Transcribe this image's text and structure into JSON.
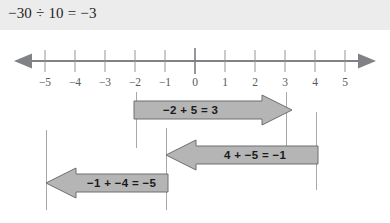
{
  "header": {
    "equation": "−30 ÷ 10 = −3",
    "band_color": "#ececed"
  },
  "numberline": {
    "axis_label": "horizontal number line with arrowheads on both ends",
    "ticks": [
      {
        "value": -5,
        "label": "−5",
        "x": 45
      },
      {
        "value": -4,
        "label": "−4",
        "x": 75
      },
      {
        "value": -3,
        "label": "−3",
        "x": 105
      },
      {
        "value": -2,
        "label": "−2",
        "x": 135
      },
      {
        "value": -1,
        "label": "−1",
        "x": 165
      },
      {
        "value": 0,
        "label": "0",
        "x": 195
      },
      {
        "value": 1,
        "label": "1",
        "x": 225
      },
      {
        "value": 2,
        "label": "2",
        "x": 255
      },
      {
        "value": 3,
        "label": "3",
        "x": 285
      },
      {
        "value": 4,
        "label": "4",
        "x": 315
      },
      {
        "value": 5,
        "label": "5",
        "x": 345
      }
    ],
    "line_color": "#808285",
    "tick_color": "#939598",
    "label_color": "#58595b"
  },
  "arrows": [
    {
      "id": "arrow-1",
      "equation": "−2 + 5 = 3",
      "direction": "right",
      "start_value": -2,
      "end_value": 3,
      "fill": "#b5b5b5",
      "stroke": "#6d6e71"
    },
    {
      "id": "arrow-2",
      "equation": "4 + −5 = −1",
      "direction": "left",
      "start_value": 4,
      "end_value": -1,
      "fill": "#b5b5b5",
      "stroke": "#6d6e71"
    },
    {
      "id": "arrow-3",
      "equation": "−1 + −4 = −5",
      "direction": "left",
      "start_value": -1,
      "end_value": -5,
      "fill": "#b5b5b5",
      "stroke": "#6d6e71"
    }
  ],
  "guides": [
    {
      "name": "guide-minus-5",
      "value": -5,
      "x": 46,
      "top": 130,
      "height": 80
    },
    {
      "name": "guide-minus-2",
      "value": -2,
      "x": 136,
      "top": 92,
      "height": 56
    },
    {
      "name": "guide-minus-1",
      "value": -1,
      "x": 166,
      "top": 128,
      "height": 82
    },
    {
      "name": "guide-3",
      "value": 3,
      "x": 286,
      "top": 92,
      "height": 62
    },
    {
      "name": "guide-4",
      "value": 4,
      "x": 316,
      "top": 112,
      "height": 78
    }
  ]
}
